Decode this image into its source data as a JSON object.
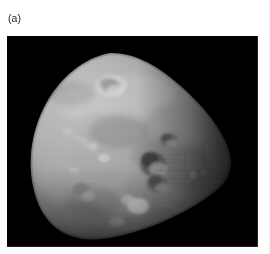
{
  "figure": {
    "panel_label": "(a)",
    "background_color": "#ffffff",
    "plate": {
      "name": "deimos-photograph",
      "space_color": "#000000",
      "body_name": "irregular moon",
      "illumination": "lit from upper-left, terminator on right",
      "surface_tone_light": "#b9b9b9",
      "surface_tone_mid": "#8c8c8c",
      "surface_tone_dark": "#3a3a3a",
      "highlight_color": "#d8d8d8",
      "crater_shadow_color": "#4a4a4a"
    }
  }
}
